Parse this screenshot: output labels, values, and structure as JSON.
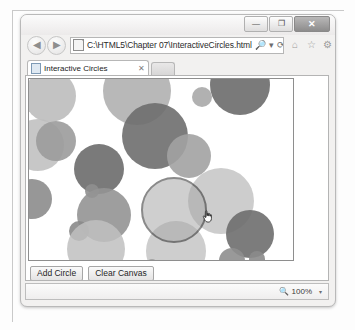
{
  "window": {
    "controls": {
      "minimize_label": "—",
      "maximize_label": "❐",
      "close_label": "✕"
    }
  },
  "navigation": {
    "back_label": "◀",
    "forward_label": "▶",
    "search_icon_label": "🔎",
    "dropdown_label": "▾",
    "refresh_label": "⟳",
    "stop_label": "✕",
    "home_icon_label": "⌂",
    "favorites_icon_label": "☆",
    "tools_icon_label": "⚙"
  },
  "address": {
    "url": "C:\\HTML5\\Chapter 07\\InteractiveCircles.html",
    "placeholder": "C:\\HTML5\\Chapter 07\\InteractiveCircles.html"
  },
  "tabs": {
    "active": {
      "label": "Interactive Circles",
      "close_label": "✕"
    }
  },
  "page": {
    "buttons": {
      "add_circle_label": "Add Circle",
      "clear_canvas_label": "Clear Canvas"
    }
  },
  "status": {
    "zoom_level": "100%",
    "zoom_caret": "▾"
  },
  "canvas_data": {
    "type": "scatter",
    "title": "Interactive Circles canvas",
    "width": 266,
    "height": 183,
    "background": "#ffffff",
    "hover_stroke": "#2b2b2b",
    "circles": [
      {
        "cx": 21,
        "cy": 17,
        "r": 26,
        "fill": "#b9b9b9",
        "opacity": 0.85,
        "hover": false
      },
      {
        "cx": 108,
        "cy": 12,
        "r": 34,
        "fill": "#b0b0b0",
        "opacity": 0.9,
        "hover": false
      },
      {
        "cx": 211,
        "cy": 6,
        "r": 30,
        "fill": "#6f6f6f",
        "opacity": 0.92,
        "hover": false
      },
      {
        "cx": 173,
        "cy": 18,
        "r": 10,
        "fill": "#a9a9a9",
        "opacity": 0.9,
        "hover": false
      },
      {
        "cx": 126,
        "cy": 57,
        "r": 33,
        "fill": "#6e6e6e",
        "opacity": 0.9,
        "hover": false
      },
      {
        "cx": 9,
        "cy": 66,
        "r": 26,
        "fill": "#bdbdbd",
        "opacity": 0.85,
        "hover": false
      },
      {
        "cx": 27,
        "cy": 62,
        "r": 20,
        "fill": "#9b9b9b",
        "opacity": 0.9,
        "hover": false
      },
      {
        "cx": 160,
        "cy": 77,
        "r": 22,
        "fill": "#a2a2a2",
        "opacity": 0.9,
        "hover": false
      },
      {
        "cx": 70,
        "cy": 90,
        "r": 25,
        "fill": "#6b6b6b",
        "opacity": 0.9,
        "hover": false
      },
      {
        "cx": 63,
        "cy": 112,
        "r": 7,
        "fill": "#8f8f8f",
        "opacity": 0.9,
        "hover": false
      },
      {
        "cx": 3,
        "cy": 120,
        "r": 20,
        "fill": "#8c8c8c",
        "opacity": 0.9,
        "hover": false
      },
      {
        "cx": 75,
        "cy": 136,
        "r": 27,
        "fill": "#949494",
        "opacity": 0.9,
        "hover": false
      },
      {
        "cx": 50,
        "cy": 152,
        "r": 10,
        "fill": "#8a8a8a",
        "opacity": 0.9,
        "hover": false
      },
      {
        "cx": 67,
        "cy": 170,
        "r": 29,
        "fill": "#c0c0c0",
        "opacity": 0.85,
        "hover": false
      },
      {
        "cx": 145,
        "cy": 131,
        "r": 33,
        "fill": "#a8a8a8",
        "opacity": 0.55,
        "hover": true
      },
      {
        "cx": 192,
        "cy": 122,
        "r": 33,
        "fill": "#bcbcbc",
        "opacity": 0.75,
        "hover": false
      },
      {
        "cx": 147,
        "cy": 172,
        "r": 30,
        "fill": "#c2c2c2",
        "opacity": 0.8,
        "hover": false
      },
      {
        "cx": 221,
        "cy": 155,
        "r": 24,
        "fill": "#6e6e6e",
        "opacity": 0.9,
        "hover": false
      },
      {
        "cx": 228,
        "cy": 180,
        "r": 8,
        "fill": "#8b8b8b",
        "opacity": 0.9,
        "hover": false
      },
      {
        "cx": 203,
        "cy": 182,
        "r": 13,
        "fill": "#8e8e8e",
        "opacity": 0.9,
        "hover": false
      },
      {
        "cx": 123,
        "cy": 186,
        "r": 6,
        "fill": "#9e9e9e",
        "opacity": 0.9,
        "hover": false
      }
    ],
    "cursor": {
      "x": 173,
      "y": 131,
      "type": "pointer-hand"
    }
  }
}
